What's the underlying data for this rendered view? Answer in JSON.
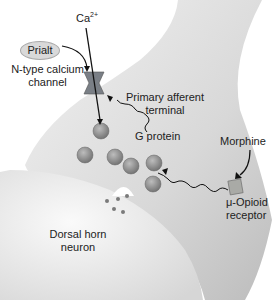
{
  "diagram": {
    "labels": {
      "ion": "Ca",
      "ion_superscript": "2+",
      "drug_block": "Prialt",
      "channel_line1": "N-type calcium",
      "channel_line2": "channel",
      "terminal_line1": "Primary afferent",
      "terminal_line2": "terminal",
      "gprotein": "G protein",
      "agonist": "Morphine",
      "receptor_line1": "μ-Opioid",
      "receptor_line2": "receptor",
      "postsyn_line1": "Dorsal horn",
      "postsyn_line2": "neuron"
    },
    "colors": {
      "terminal_fill": "#dcdcdc",
      "neuron_fill": "#efefef",
      "channel_fill": "#7a7f86",
      "receptor_fill": "#a9aaa6",
      "vesicle_fill": "#8f8f8f",
      "arrow": "#111111"
    }
  }
}
